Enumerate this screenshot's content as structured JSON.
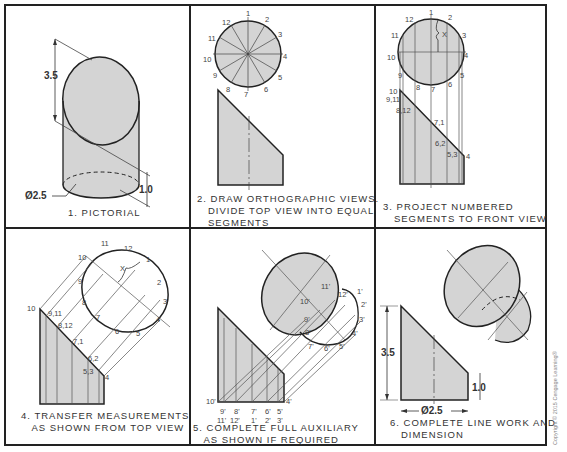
{
  "figure": {
    "panels": [
      {
        "id": 1,
        "caption": "1. PICTORIAL",
        "dims": {
          "height": "3.5",
          "diameter": "Ø2.5",
          "short": "1.0"
        }
      },
      {
        "id": 2,
        "caption": "2. DRAW ORTHOGRAPHIC VIEWS.\n   DIVIDE TOP VIEW INTO EQUAL\n   SEGMENTS",
        "points": [
          "1",
          "2",
          "3",
          "4",
          "5",
          "6",
          "7",
          "8",
          "9",
          "10",
          "11",
          "12"
        ]
      },
      {
        "id": 3,
        "caption": "3. PROJECT NUMBERED\n   SEGMENTS TO FRONT VIEW",
        "top_points": [
          "1",
          "2",
          "3",
          "4",
          "5",
          "6",
          "7",
          "8",
          "9",
          "10",
          "11",
          "12"
        ],
        "front_points": [
          "10",
          "9,11",
          "8,12",
          "7,1",
          "6,2",
          "5,3",
          "4"
        ],
        "x_label": "X"
      },
      {
        "id": 4,
        "caption": "4. TRANSFER MEASUREMENTS\n   AS SHOWN FROM TOP VIEW",
        "ellipse_points": [
          "10",
          "11",
          "12",
          "1",
          "2",
          "3",
          "4",
          "5",
          "6",
          "7",
          "8",
          "9"
        ],
        "front_points": [
          "10",
          "9,11",
          "8,12",
          "7,1",
          "6,2",
          "5,3",
          "4"
        ],
        "x_label": "X"
      },
      {
        "id": 5,
        "caption": "5. COMPLETE FULL AUXILIARY\n   AS SHOWN IF REQUIRED",
        "aux_points": [
          "11'",
          "12'",
          "1'",
          "2'",
          "3'",
          "4'",
          "5'",
          "6'",
          "7'",
          "8'",
          "9'",
          "10'"
        ],
        "base_top": [
          "10'",
          "9'",
          "8'",
          "7'",
          "6'",
          "5'",
          "4'"
        ],
        "base_bottom": [
          "11'",
          "12'",
          "1'",
          "2'",
          "3'"
        ]
      },
      {
        "id": 6,
        "caption": "6. COMPLETE LINE WORK AND\n   DIMENSION",
        "dims": {
          "height": "3.5",
          "diameter": "Ø2.5",
          "short": "1.0"
        }
      }
    ],
    "copyright": "Copyright © 2015 Cengage Learning®"
  },
  "colors": {
    "fill": "#d4d4d4",
    "line": "#222222",
    "thin": "#666666"
  }
}
